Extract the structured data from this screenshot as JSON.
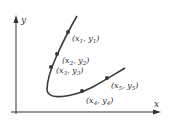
{
  "diagram": {
    "axes": {
      "x_label": "x",
      "y_label": "y"
    },
    "points": [
      {
        "label": "(x1, y1)",
        "sub": "1"
      },
      {
        "label": "(x2, y2)",
        "sub": "2"
      },
      {
        "label": "(x3, y3)",
        "sub": "3"
      },
      {
        "label": "(x4, y4)",
        "sub": "4"
      },
      {
        "label": "(x5, y5)",
        "sub": "5"
      }
    ],
    "colors": {
      "axis": "#333333",
      "curve": "#3a3a3a",
      "point": "#3a3a3a"
    }
  }
}
